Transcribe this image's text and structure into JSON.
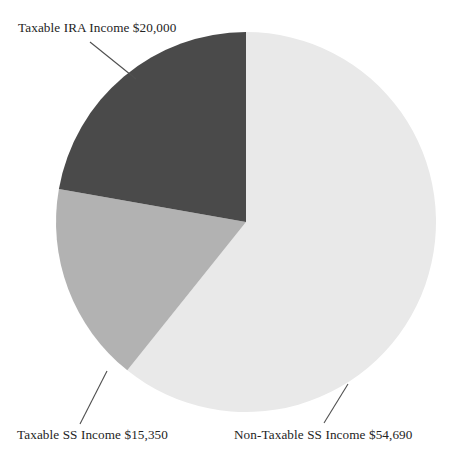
{
  "chart_data": {
    "type": "pie",
    "title": "",
    "subtitle": "",
    "xlabel": "",
    "ylabel": "",
    "legend_position": "none",
    "grid": false,
    "total": 90040,
    "currency_symbol": "$",
    "categories": [
      "Taxable IRA Income",
      "Taxable SS Income",
      "Non-Taxable SS Income"
    ],
    "values": [
      20000,
      15350,
      54690
    ],
    "value_labels": [
      "$20,000",
      "$15,350",
      "$54,690"
    ],
    "percentages": [
      22.2,
      17.0,
      60.7
    ],
    "colors": [
      "#4a4a4a",
      "#b2b2b2",
      "#e9e9e9"
    ],
    "slices": [
      {
        "name": "Taxable IRA Income",
        "value": 20000,
        "value_label": "$20,000",
        "full_label": "Taxable IRA Income $20,000",
        "color": "#4a4a4a",
        "percent": 22.2,
        "start_angle_deg": 0,
        "end_angle_deg": 80,
        "direction": "counterclockwise"
      },
      {
        "name": "Taxable SS Income",
        "value": 15350,
        "value_label": "$15,350",
        "full_label": "Taxable SS Income $15,350",
        "color": "#b2b2b2",
        "percent": 17.0,
        "start_angle_deg": 80,
        "end_angle_deg": 141.4,
        "direction": "counterclockwise"
      },
      {
        "name": "Non-Taxable SS Income",
        "value": 54690,
        "value_label": "$54,690",
        "full_label": "Non-Taxable SS Income $54,690",
        "color": "#e9e9e9",
        "percent": 60.7,
        "start_angle_deg": 141.4,
        "end_angle_deg": 360,
        "direction": "counterclockwise"
      }
    ]
  },
  "labels": {
    "ira": "Taxable IRA Income $20,000",
    "taxable_ss": "Taxable SS Income $15,350",
    "nontaxable_ss": "Non-Taxable SS Income $54,690"
  },
  "geometry": {
    "center_x": 246,
    "center_y": 222,
    "radius": 190
  }
}
